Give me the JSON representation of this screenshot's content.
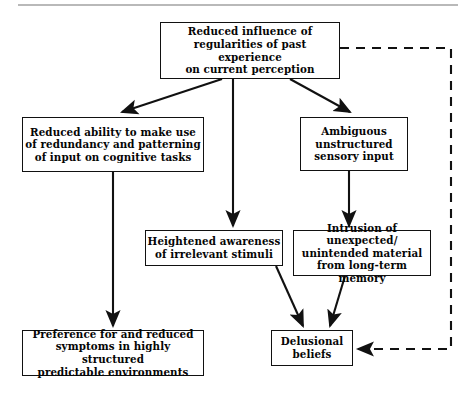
{
  "diagram": {
    "line_color": "#111111",
    "background_color": "#ffffff",
    "nodes": [
      {
        "id": "root",
        "label": "Reduced influence of\nregularities of past experience\non current perception"
      },
      {
        "id": "reduced_ability",
        "label": "Reduced ability to make use\nof redundancy and patterning\nof input on cognitive tasks"
      },
      {
        "id": "ambiguous",
        "label": "Ambiguous\nunstructured\nsensory input"
      },
      {
        "id": "heightened",
        "label": "Heightened awareness\nof irrelevant stimuli"
      },
      {
        "id": "intrusion",
        "label": "Intrusion of unexpected/\nunintended material\nfrom long-term memory"
      },
      {
        "id": "preference",
        "label": "Preference for and reduced\nsymptoms in highly structured\npredictable environments"
      },
      {
        "id": "delusional",
        "label": "Delusional\nbeliefs"
      }
    ],
    "edges": [
      {
        "id": "root-to-reduced-ability",
        "from": "root",
        "to": "reduced_ability",
        "style": "solid",
        "shape": "diagonal"
      },
      {
        "id": "root-to-heightened",
        "from": "root",
        "to": "heightened",
        "style": "solid",
        "shape": "vertical"
      },
      {
        "id": "root-to-ambiguous",
        "from": "root",
        "to": "ambiguous",
        "style": "solid",
        "shape": "diagonal"
      },
      {
        "id": "reduced-ability-to-preference",
        "from": "reduced_ability",
        "to": "preference",
        "style": "solid",
        "shape": "vertical"
      },
      {
        "id": "ambiguous-to-intrusion",
        "from": "ambiguous",
        "to": "intrusion",
        "style": "solid",
        "shape": "vertical"
      },
      {
        "id": "heightened-to-delusional",
        "from": "heightened",
        "to": "delusional",
        "style": "solid",
        "shape": "diagonal"
      },
      {
        "id": "intrusion-to-delusional",
        "from": "intrusion",
        "to": "delusional",
        "style": "solid",
        "shape": "diagonal"
      },
      {
        "id": "root-to-delusional-feedback",
        "from": "root",
        "to": "delusional",
        "style": "dashed",
        "shape": "orthogonal"
      }
    ]
  }
}
